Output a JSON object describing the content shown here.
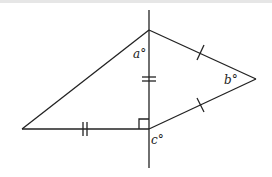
{
  "diagram": {
    "type": "geometry",
    "stroke_color": "#222222",
    "labels": {
      "a": "a°",
      "b": "b°",
      "c": "c°"
    },
    "points": {
      "top": [
        149,
        30
      ],
      "left": [
        22,
        129
      ],
      "foot": [
        149,
        129
      ],
      "right": [
        256,
        79
      ]
    },
    "markings": {
      "right_angle_at": "foot",
      "double_ticks": [
        "vertical segment top-foot",
        "horizontal segment left-foot"
      ],
      "single_ticks": [
        "segment top-right",
        "segment foot-right"
      ]
    }
  }
}
